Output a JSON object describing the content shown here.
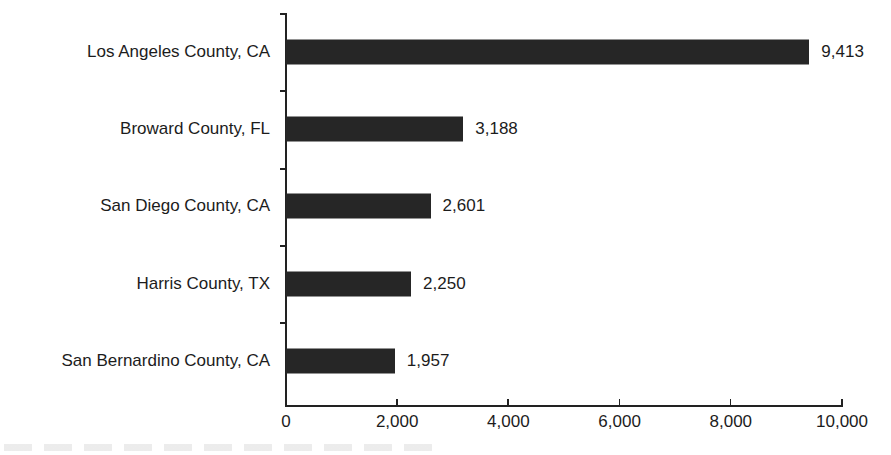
{
  "chart_data": {
    "type": "bar",
    "orientation": "horizontal",
    "title": "",
    "xlabel": "",
    "ylabel": "",
    "categories": [
      "Los Angeles County, CA",
      "Broward County, FL",
      "San Diego County, CA",
      "Harris County, TX",
      "San Bernardino County, CA"
    ],
    "values": [
      9413,
      3188,
      2601,
      2250,
      1957
    ],
    "value_labels": [
      "9,413",
      "3,188",
      "2,601",
      "2,250",
      "1,957"
    ],
    "xlim": [
      0,
      10000
    ],
    "x_ticks": [
      0,
      2000,
      4000,
      6000,
      8000,
      10000
    ],
    "x_tick_labels": [
      "0",
      "2,000",
      "4,000",
      "6,000",
      "8,000",
      "10,000"
    ],
    "grid": false,
    "legend": null,
    "bar_color": "#262626"
  }
}
